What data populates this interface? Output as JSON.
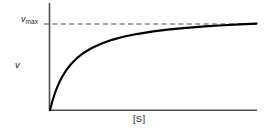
{
  "figure": {
    "title": "",
    "background_color": "#ffffff",
    "axis_color": "#4d4d4d",
    "curve_color": "#000000",
    "asymptote_color": "#4d4d4d",
    "text_color": "#1a1a1a"
  },
  "labels": {
    "y_axis": "v",
    "x_axis": "[S]",
    "asymptote_symbol": "v",
    "asymptote_subscript": "max",
    "asymptote_full": "vmax"
  },
  "chart_data": {
    "type": "line",
    "title": "",
    "xlabel": "[S]",
    "ylabel": "v",
    "grid": false,
    "legend": null,
    "xlim": [
      0,
      10
    ],
    "ylim": [
      0,
      1.12
    ],
    "annotations": [
      {
        "name": "vmax-asymptote",
        "text": "vmax",
        "type": "horizontal-dashed-line",
        "y": 1.0
      }
    ],
    "series": [
      {
        "name": "michaelis-menten",
        "equation": "v = vmax * [S] / (Km + [S])",
        "vmax": 1.0,
        "Km": 1.1,
        "x": [
          0,
          0.1,
          0.2,
          0.3,
          0.45,
          0.6,
          0.8,
          1.0,
          1.3,
          1.6,
          2.0,
          2.5,
          3.0,
          3.6,
          4.2,
          5.0,
          5.8,
          6.6,
          7.5,
          8.4,
          9.2,
          10.0
        ],
        "values": [
          0.0,
          0.083,
          0.154,
          0.214,
          0.29,
          0.353,
          0.421,
          0.476,
          0.542,
          0.593,
          0.645,
          0.694,
          0.732,
          0.766,
          0.792,
          0.82,
          0.841,
          0.857,
          0.872,
          0.884,
          0.893,
          0.901
        ]
      }
    ]
  }
}
